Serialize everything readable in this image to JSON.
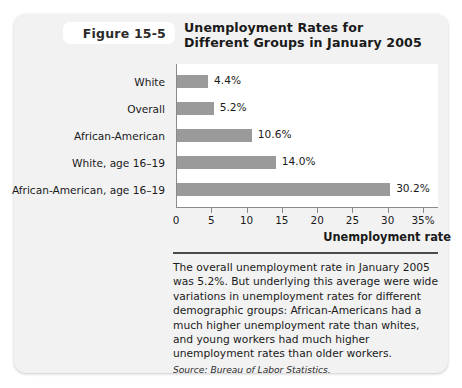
{
  "figure": {
    "label": "Figure 15-5",
    "title_line1": "Unemployment Rates for",
    "title_line2": "Different Groups in January 2005"
  },
  "caption": {
    "text": "The overall unemployment rate in January 2005 was 5.2%. But underlying this average were wide variations in unemployment rates for different demographic groups: African-Americans had a much higher unemployment rate than whites, and young workers had much higher unemployment rates than older workers.",
    "source": "Source: Bureau of Labor Statistics."
  },
  "colors": {
    "card_background": "#f2f2f2",
    "plot_background": "#ffffff",
    "bar_fill": "#9a9a9a",
    "axis": "#8a8a8a",
    "text": "#1a1a1a",
    "rule": "#4a4a4a"
  },
  "chart_data": {
    "type": "bar",
    "orientation": "horizontal",
    "title": "Unemployment Rates for Different Groups in January 2005",
    "xlabel": "Unemployment rate",
    "ylabel": "",
    "categories": [
      "White",
      "Overall",
      "African-American",
      "White, age 16–19",
      "African-American, age 16–19"
    ],
    "values": [
      4.4,
      5.2,
      10.6,
      14.0,
      30.2
    ],
    "value_labels": [
      "4.4%",
      "5.2%",
      "10.6%",
      "14.0%",
      "30.2%"
    ],
    "xlim": [
      0,
      35
    ],
    "xticks": [
      0,
      5,
      10,
      15,
      20,
      25,
      30,
      35
    ],
    "xtick_labels": [
      "0",
      "5",
      "10",
      "15",
      "20",
      "25",
      "30",
      "35%"
    ],
    "grid": false,
    "legend": false,
    "series": [
      {
        "name": "Unemployment rate (%)",
        "values": [
          4.4,
          5.2,
          10.6,
          14.0,
          30.2
        ]
      }
    ]
  }
}
